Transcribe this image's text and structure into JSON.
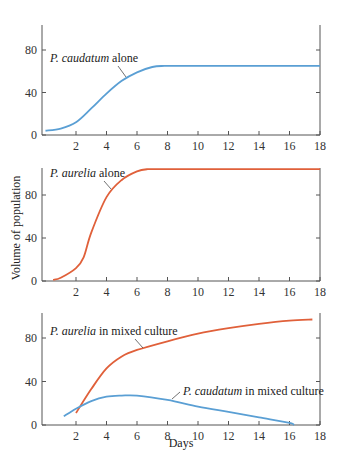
{
  "colors": {
    "caudatum": "#5a9fd4",
    "aurelia": "#e0603a",
    "axis": "#555555"
  },
  "ylabel": "Volume of population",
  "xlabel": "Days",
  "xticks": [
    "2",
    "4",
    "6",
    "8",
    "10",
    "12",
    "14",
    "16",
    "18"
  ],
  "yticks": [
    "0",
    "40",
    "80"
  ],
  "chart_data": [
    {
      "type": "line",
      "title": "",
      "xlabel": "",
      "ylabel": "Volume of population",
      "xlim": [
        0,
        18
      ],
      "ylim": [
        0,
        105
      ],
      "x_ticks": [
        2,
        4,
        6,
        8,
        10,
        12,
        14,
        16,
        18
      ],
      "y_ticks": [
        0,
        40,
        80
      ],
      "grid": false,
      "annotations": [
        "P. caudatum alone"
      ],
      "series": [
        {
          "name": "P. caudatum alone",
          "color": "#5a9fd4",
          "x": [
            0,
            1,
            2,
            3,
            4,
            5,
            6,
            7,
            7.8,
            10,
            12,
            14,
            16,
            18
          ],
          "y": [
            4,
            6,
            12,
            25,
            39,
            51,
            59,
            64,
            65,
            65,
            65,
            65,
            65,
            65
          ]
        }
      ]
    },
    {
      "type": "line",
      "title": "",
      "xlabel": "",
      "ylabel": "Volume of population",
      "xlim": [
        0,
        18
      ],
      "ylim": [
        0,
        105
      ],
      "x_ticks": [
        2,
        4,
        6,
        8,
        10,
        12,
        14,
        16,
        18
      ],
      "y_ticks": [
        0,
        40,
        80
      ],
      "grid": false,
      "annotations": [
        "P. aurelia alone"
      ],
      "series": [
        {
          "name": "P. aurelia alone",
          "color": "#e0603a",
          "x": [
            0.5,
            1,
            2,
            2.5,
            3,
            4,
            5,
            6,
            6.7,
            8,
            10,
            12,
            14,
            16,
            18
          ],
          "y": [
            1,
            3,
            12,
            22,
            45,
            78,
            94,
            102,
            104,
            104,
            104,
            104,
            104,
            104,
            104
          ]
        }
      ]
    },
    {
      "type": "line",
      "title": "",
      "xlabel": "Days",
      "ylabel": "Volume of population",
      "xlim": [
        0,
        18
      ],
      "ylim": [
        0,
        105
      ],
      "x_ticks": [
        2,
        4,
        6,
        8,
        10,
        12,
        14,
        16,
        18
      ],
      "y_ticks": [
        0,
        40,
        80
      ],
      "grid": false,
      "annotations": [
        "P. aurelia in mixed culture",
        "P. caudatum in mixed culture"
      ],
      "series": [
        {
          "name": "P. aurelia in mixed culture",
          "color": "#e0603a",
          "x": [
            2,
            3,
            4,
            5,
            6,
            8,
            10,
            12,
            14,
            16,
            17.5
          ],
          "y": [
            11,
            33,
            52,
            63,
            69,
            77,
            84,
            89,
            93,
            96,
            97
          ]
        },
        {
          "name": "P. caudatum in mixed culture",
          "color": "#5a9fd4",
          "x": [
            1.2,
            2,
            3,
            4,
            5,
            6,
            8,
            10,
            12,
            14,
            16,
            16.3
          ],
          "y": [
            8,
            15,
            22,
            26,
            27,
            27,
            23,
            17,
            12,
            7,
            2,
            0
          ]
        }
      ]
    }
  ],
  "panels": [
    {
      "label_italic": "P. caudatum",
      "label_rest": " alone"
    },
    {
      "label_italic": "P. aurelia",
      "label_rest": " alone"
    },
    {
      "label_italic": "P. aurelia",
      "label_rest": " in mixed culture",
      "label2_italic": "P. caudatum",
      "label2_rest": " in mixed culture"
    }
  ]
}
